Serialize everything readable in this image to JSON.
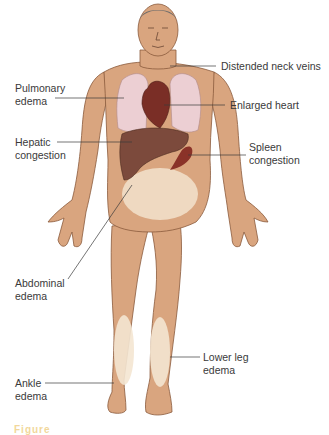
{
  "figure": {
    "colors": {
      "skin": "#d9a57f",
      "skin_outline": "#8a5a3c",
      "lung": "#eccfd3",
      "heart": "#7a2e26",
      "liver": "#7c4a3c",
      "spleen": "#8a3228",
      "edema": "#f4e6d2",
      "hair": "#6b6b6b",
      "leader_line": "#3a3a3a",
      "caption": "#e8b84a"
    },
    "labels": {
      "neck_veins": "Distended neck veins",
      "pulmonary": "Pulmonary\nedema",
      "heart": "Enlarged heart",
      "hepatic": "Hepatic\ncongestion",
      "spleen": "Spleen\ncongestion",
      "abdominal": "Abdominal\nedema",
      "lower_leg": "Lower leg\nedema",
      "ankle": "Ankle\nedema"
    },
    "caption": "Figure"
  }
}
